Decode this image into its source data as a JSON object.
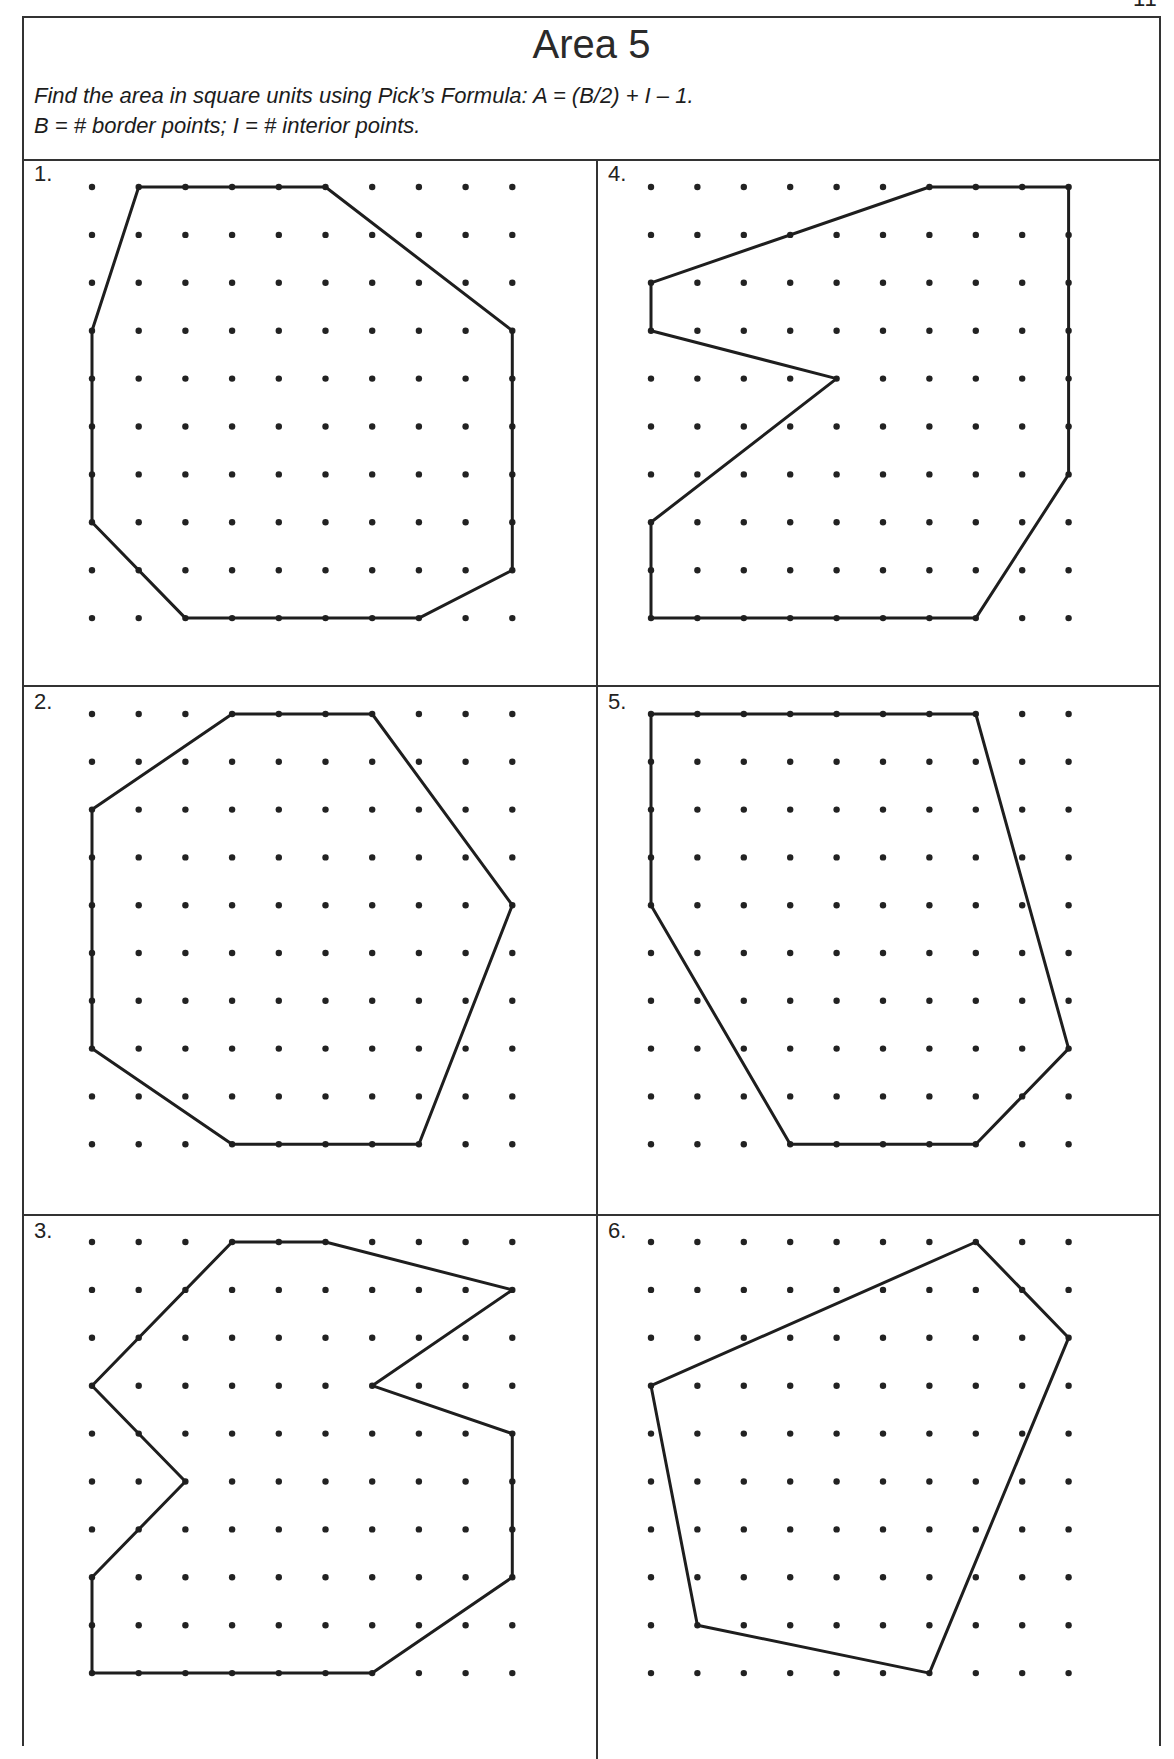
{
  "page": {
    "page_number_partial": "11"
  },
  "header": {
    "title": "Area 5",
    "instruction_line1": "Find the area in square units using Pick’s Formula: A = (B/2) + I – 1.",
    "instruction_line2": "B = # border points; I = # interior points."
  },
  "grid": {
    "columns": 10,
    "rows": 10,
    "dot_color": "#222222",
    "line_color": "#1e1e1e"
  },
  "problems": [
    {
      "label": "1.",
      "vertices": [
        [
          1,
          0
        ],
        [
          5,
          0
        ],
        [
          9,
          3
        ],
        [
          9,
          8
        ],
        [
          7,
          9
        ],
        [
          2,
          9
        ],
        [
          0,
          7
        ],
        [
          0,
          3
        ]
      ]
    },
    {
      "label": "2.",
      "vertices": [
        [
          3,
          0
        ],
        [
          6,
          0
        ],
        [
          9,
          4
        ],
        [
          7,
          9
        ],
        [
          3,
          9
        ],
        [
          0,
          7
        ],
        [
          0,
          2
        ]
      ]
    },
    {
      "label": "3.",
      "vertices": [
        [
          3,
          0
        ],
        [
          5,
          0
        ],
        [
          9,
          1
        ],
        [
          6,
          3
        ],
        [
          9,
          4
        ],
        [
          9,
          7
        ],
        [
          6,
          9
        ],
        [
          0,
          9
        ],
        [
          0,
          7
        ],
        [
          2,
          5
        ],
        [
          0,
          3
        ]
      ]
    },
    {
      "label": "4.",
      "vertices": [
        [
          6,
          0
        ],
        [
          9,
          0
        ],
        [
          9,
          6
        ],
        [
          7,
          9
        ],
        [
          0,
          9
        ],
        [
          0,
          7
        ],
        [
          4,
          4
        ],
        [
          0,
          3
        ],
        [
          0,
          2
        ]
      ]
    },
    {
      "label": "5.",
      "vertices": [
        [
          0,
          0
        ],
        [
          7,
          0
        ],
        [
          9,
          7
        ],
        [
          7,
          9
        ],
        [
          3,
          9
        ],
        [
          0,
          4
        ]
      ]
    },
    {
      "label": "6.",
      "vertices": [
        [
          7,
          0
        ],
        [
          9,
          2
        ],
        [
          6,
          9
        ],
        [
          1,
          8
        ],
        [
          0,
          3
        ]
      ]
    }
  ]
}
